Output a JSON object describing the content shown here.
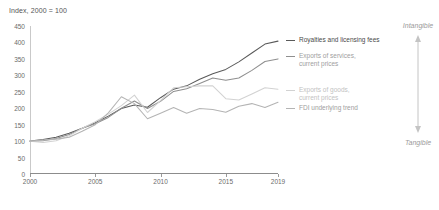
{
  "chart_data": {
    "type": "line",
    "title": "Index, 2000 = 100",
    "xlabel": "",
    "ylabel": "Index, 2000 = 100",
    "grid": false,
    "legend_position": "right",
    "xlim": [
      2000,
      2019
    ],
    "ylim": [
      0,
      450
    ],
    "yticks": [
      450,
      400,
      350,
      300,
      250,
      200,
      150,
      100,
      50,
      0
    ],
    "xticks": [
      2000,
      2005,
      2010,
      2015,
      2019
    ],
    "x": [
      2000,
      2001,
      2002,
      2003,
      2004,
      2005,
      2006,
      2007,
      2008,
      2009,
      2010,
      2011,
      2012,
      2013,
      2014,
      2015,
      2016,
      2017,
      2018,
      2019
    ],
    "series": [
      {
        "name": "Royalties and licensing fees",
        "color": "#5a5a5a",
        "values": [
          100,
          105,
          112,
          124,
          139,
          156,
          176,
          199,
          210,
          203,
          232,
          258,
          268,
          288,
          305,
          318,
          341,
          368,
          395,
          404
        ]
      },
      {
        "name": "Exports of services,\ncurrent prices",
        "color": "#8f8f8f",
        "values": [
          100,
          101,
          108,
          120,
          139,
          153,
          172,
          200,
          222,
          199,
          221,
          251,
          259,
          275,
          292,
          285,
          292,
          315,
          342,
          350
        ]
      },
      {
        "name": "Exports of goods,\ncurrent prices",
        "color": "#d2d2d2",
        "values": [
          100,
          96,
          101,
          116,
          139,
          159,
          182,
          208,
          240,
          187,
          223,
          262,
          265,
          268,
          268,
          229,
          225,
          243,
          262,
          258
        ]
      },
      {
        "name": "FDI underlying trend",
        "color": "#b4b4b4",
        "values": [
          100,
          103,
          106,
          112,
          130,
          150,
          186,
          235,
          214,
          168,
          185,
          202,
          185,
          199,
          196,
          188,
          206,
          214,
          202,
          218
        ]
      }
    ],
    "annotations": {
      "axis_top_label": "Intangible",
      "axis_bottom_label": "Tangible"
    }
  },
  "legend": {
    "items": [
      {
        "label": "Royalties and licensing fees",
        "color": "#5a5a5a"
      },
      {
        "label": "Exports of services,\ncurrent prices",
        "color": "#8f8f8f"
      },
      {
        "label": "Exports of goods,\ncurrent prices",
        "color": "#d2d2d2"
      },
      {
        "label": "FDI underlying trend",
        "color": "#b4b4b4"
      }
    ]
  }
}
